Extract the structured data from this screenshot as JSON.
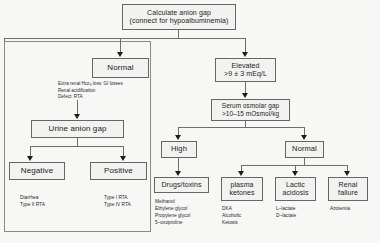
{
  "diagram": {
    "nodes": {
      "root": {
        "line1": "Calculate anion gap",
        "line2": "(connect for hypoalbuminemia)"
      },
      "normal": {
        "line1": "Normal"
      },
      "elevated": {
        "line1": "Elevated",
        "line2": ">9 ± 3 mEq/L"
      },
      "urine_anion_gap": {
        "line1": "Urine anion gap"
      },
      "negative": {
        "line1": "Negative"
      },
      "positive": {
        "line1": "Positive"
      },
      "serum_osmolar_gap": {
        "line1": "Serum osmolar gap",
        "line2": ">10–15 mOsmol/kg"
      },
      "high": {
        "line1": "High"
      },
      "osm_normal": {
        "line1": "Normal"
      },
      "drugs_toxins": {
        "line1": "Drugs/toxins"
      },
      "plasma_ketones": {
        "line1": "plasma",
        "line2": "ketones"
      },
      "lactic_acidosis": {
        "line1": "Lactic",
        "line2": "acidosis"
      },
      "renal_failure": {
        "line1": "Renal",
        "line2": "failure"
      }
    },
    "captions": {
      "normal_notes": {
        "line1": "Extra renal Hco₃ loss: GI losses",
        "line2": "Renal acidification",
        "line3": "Defect: RTA"
      },
      "negative_notes": {
        "line1": "Diarrhea",
        "line2": "Type II RTA"
      },
      "positive_notes": {
        "line1": "Type I RTA",
        "line2": "Type IV RTA"
      },
      "drugs_notes": {
        "line1": "Methanol",
        "line2": "Ethylene glycol",
        "line3": "Propylene glycol",
        "line4": "5–oxoproline"
      },
      "ketones_notes": {
        "line1": "DKA",
        "line2": "Alcoholic",
        "line3": "Ketosis"
      },
      "lactate_notes": {
        "line1": "L–lactate",
        "line2": "D–lactate"
      },
      "renal_notes": {
        "line1": "Azotemia"
      }
    },
    "colors": {
      "page_background": "#f7f7f5",
      "node_fill": "#f2f2f0",
      "node_border": "#666666",
      "connector": "#6e6e6e",
      "text": "#1b1b1b",
      "group_frame": "#8a8a8a"
    }
  }
}
